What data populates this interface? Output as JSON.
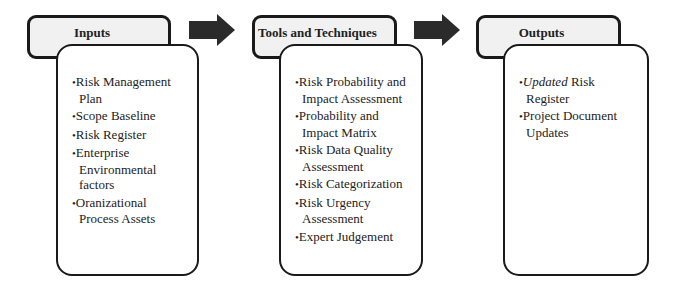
{
  "diagram": {
    "stages": [
      {
        "title": "Inputs",
        "items": [
          "Risk Management Plan",
          "Scope Baseline",
          "Risk Register",
          "Enterprise Environmental factors",
          "Oranizational Process Assets"
        ]
      },
      {
        "title": "Tools and Techniques",
        "items": [
          "Risk Probability and Impact Assessment",
          "Probability and Impact Matrix",
          "Risk Data Quality Assessment",
          "Risk Categorization",
          "Risk Urgency Assessment",
          "Expert Judgement"
        ]
      },
      {
        "title": "Outputs",
        "items": [
          {
            "italic": "Updated",
            "rest": " Risk Register"
          },
          "Project Document Updates"
        ]
      }
    ],
    "arrow_color": "#2b2b2b",
    "border_color": "#1a1a1a",
    "header_fill": "#f1f1f1"
  }
}
